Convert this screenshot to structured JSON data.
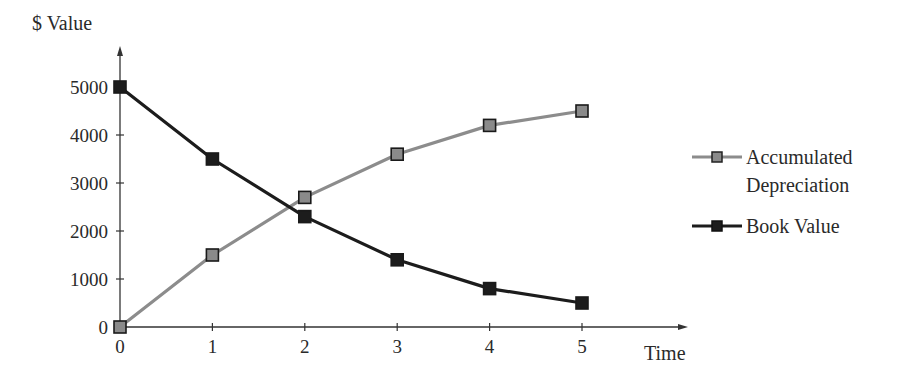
{
  "chart_data": {
    "type": "line",
    "title": "",
    "xlabel": "Time",
    "ylabel": "$ Value",
    "x": [
      0,
      1,
      2,
      3,
      4,
      5
    ],
    "x_tick_labels": [
      "0",
      "1",
      "2",
      "3",
      "4",
      "5"
    ],
    "y_tick_labels": [
      "0",
      "1000",
      "2000",
      "3000",
      "4000",
      "5000"
    ],
    "y_ticks": [
      0,
      1000,
      2000,
      3000,
      4000,
      5000
    ],
    "ylim": [
      0,
      5000
    ],
    "xlim": [
      0,
      5
    ],
    "grid": false,
    "legend_position": "right",
    "series": [
      {
        "name": "Accumulated Depreciation",
        "legend_lines": [
          "Accumulated",
          "Depreciation"
        ],
        "values": [
          0,
          1500,
          2700,
          3600,
          4200,
          4500
        ],
        "line_color": "#8c8c8c",
        "marker_fill": "#8a8a8a",
        "marker": "square"
      },
      {
        "name": "Book Value",
        "legend_lines": [
          "Book Value"
        ],
        "values": [
          5000,
          3500,
          2300,
          1400,
          800,
          500
        ],
        "line_color": "#1c1c1c",
        "marker_fill": "#1c1c1c",
        "marker": "square"
      }
    ]
  }
}
